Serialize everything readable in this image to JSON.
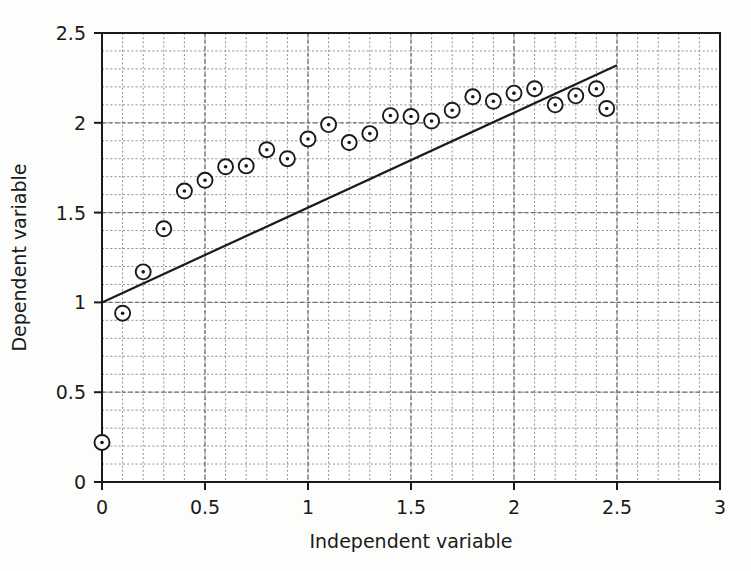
{
  "chart_data": {
    "type": "scatter",
    "title": "",
    "xlabel": "Independent variable",
    "ylabel": "Dependent variable",
    "xlim": [
      0,
      3
    ],
    "ylim": [
      0,
      2.5
    ],
    "xticks": [
      "0",
      "0.5",
      "1",
      "1.5",
      "2",
      "2.5",
      "3"
    ],
    "xtick_values": [
      0,
      0.5,
      1,
      1.5,
      2,
      2.5,
      3
    ],
    "yticks": [
      "0",
      "0.5",
      "1",
      "1.5",
      "2",
      "2.5"
    ],
    "ytick_values": [
      0,
      0.5,
      1,
      1.5,
      2,
      2.5
    ],
    "grid": "major and minor dashed, minor step 0.1",
    "grid_minor_step_x": 0.1,
    "grid_minor_step_y": 0.1,
    "legend": "none",
    "marker_style": "open-circle-with-center-dot",
    "series": [
      {
        "name": "Observed data",
        "type": "scatter",
        "x": [
          0.0,
          0.1,
          0.2,
          0.3,
          0.4,
          0.5,
          0.6,
          0.7,
          0.8,
          0.9,
          1.0,
          1.1,
          1.2,
          1.3,
          1.4,
          1.5,
          1.6,
          1.7,
          1.8,
          1.9,
          2.0,
          2.1,
          2.2,
          2.3,
          2.4,
          2.45
        ],
        "y": [
          0.22,
          0.94,
          1.17,
          1.41,
          1.62,
          1.68,
          1.755,
          1.76,
          1.85,
          1.8,
          1.91,
          1.99,
          1.89,
          1.94,
          2.04,
          2.035,
          2.01,
          2.07,
          2.145,
          2.12,
          2.165,
          2.19,
          2.1,
          2.15,
          2.19,
          2.08
        ]
      },
      {
        "name": "Reference line",
        "type": "line",
        "x": [
          0.0,
          2.5
        ],
        "y": [
          1.0,
          2.32
        ]
      }
    ],
    "line_slope": 0.528,
    "line_intercept": 1.0,
    "colors": {
      "marker_stroke": "#1a1a1a",
      "marker_fill": "#ffffff",
      "marker_dot": "#1a1a1a",
      "line": "#1a1a1a",
      "grid": "#8c8c8c",
      "axis": "#1a1a1a",
      "background": "#fdfdfc"
    }
  }
}
